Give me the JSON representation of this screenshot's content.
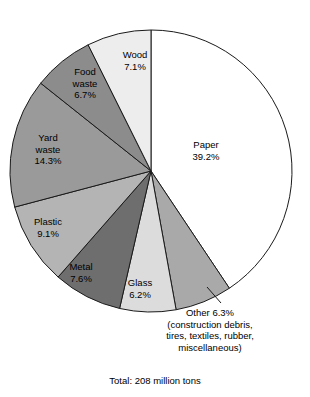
{
  "chart_data": {
    "type": "pie",
    "title": "",
    "subtitle": "",
    "caption": "Total: 208 million tons",
    "units": "percent",
    "start_angle_deg": 0,
    "direction": "clockwise",
    "legend": "none (direct labels on slices)",
    "categories": [
      "Paper",
      "Other",
      "Glass",
      "Metal",
      "Plastic",
      "Yard waste",
      "Food waste",
      "Wood"
    ],
    "values": [
      39.2,
      6.3,
      6.2,
      7.6,
      9.1,
      14.3,
      6.7,
      7.1
    ],
    "slices": [
      {
        "name": "Paper",
        "label": "Paper",
        "percent": "39.2%",
        "value": 39.2,
        "color": "#ffffff",
        "label_x": 206,
        "label_y": 139
      },
      {
        "name": "Other",
        "label": "Other",
        "percent": "6.3%",
        "value": 6.3,
        "color": "#a9a9a9",
        "callout": true,
        "note_lines": [
          "(construction debris,",
          "tires, textiles, rubber,",
          "miscellaneous)"
        ],
        "label_x": 210,
        "label_y": 307
      },
      {
        "name": "Glass",
        "label": "Glass",
        "percent": "6.2%",
        "value": 6.2,
        "color": "#dcdcdc",
        "label_x": 140,
        "label_y": 277
      },
      {
        "name": "Metal",
        "label": "Metal",
        "percent": "7.6%",
        "value": 7.6,
        "color": "#6e6e6e",
        "label_x": 81,
        "label_y": 261
      },
      {
        "name": "Plastic",
        "label": "Plastic",
        "percent": "9.1%",
        "value": 9.1,
        "color": "#b4b4b4",
        "label_x": 48,
        "label_y": 216
      },
      {
        "name": "Yard waste",
        "label_lines": [
          "Yard",
          "waste"
        ],
        "percent": "14.3%",
        "value": 14.3,
        "color": "#9a9a9a",
        "label_x": 48,
        "label_y": 132
      },
      {
        "name": "Food waste",
        "label_lines": [
          "Food",
          "waste"
        ],
        "percent": "6.7%",
        "value": 6.7,
        "color": "#8c8c8c",
        "label_x": 85,
        "label_y": 66
      },
      {
        "name": "Wood",
        "label": "Wood",
        "percent": "7.1%",
        "value": 7.1,
        "color": "#ededed",
        "label_x": 135,
        "label_y": 49
      }
    ],
    "geometry": {
      "center_x": 151,
      "center_y": 171,
      "radius": 141
    },
    "colors": {
      "outline": "#1a1a1a",
      "background": "#ffffff"
    }
  }
}
